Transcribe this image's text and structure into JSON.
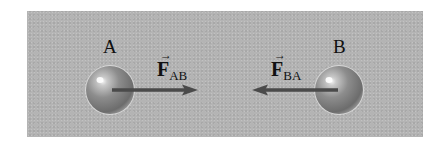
{
  "diagram": {
    "objects": [
      {
        "id": "A",
        "label": "A"
      },
      {
        "id": "B",
        "label": "B"
      }
    ],
    "forces": [
      {
        "symbol": "F",
        "subscript": "AB",
        "vector_mark": "→",
        "direction": "right"
      },
      {
        "symbol": "F",
        "subscript": "BA",
        "vector_mark": "→",
        "direction": "left"
      }
    ],
    "colors": {
      "background": "#b4b4b4",
      "arrow": "#4a4a4a",
      "text": "#111111"
    }
  }
}
